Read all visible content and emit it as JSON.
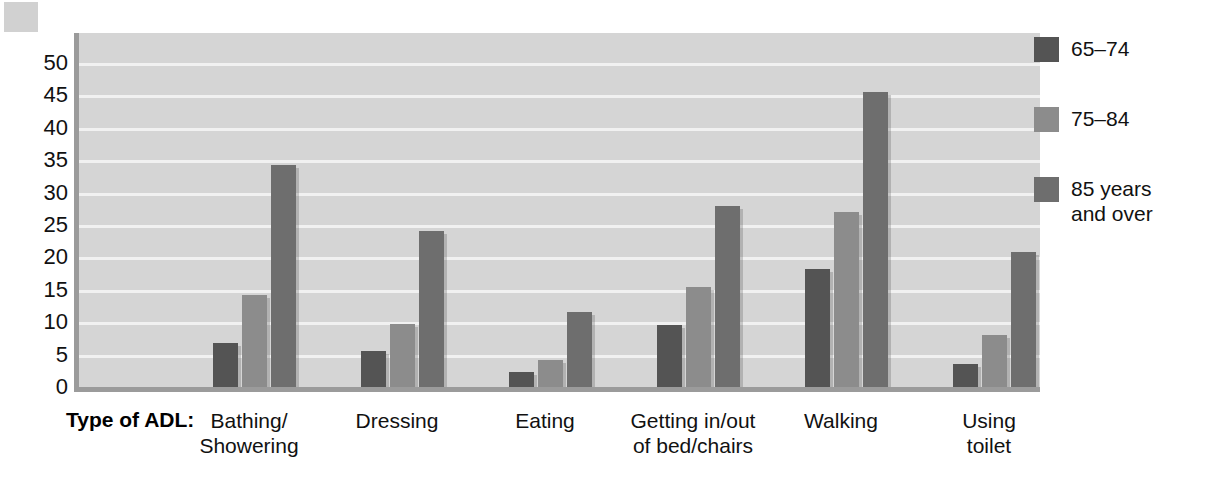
{
  "chart_data": {
    "type": "bar",
    "title": "",
    "xlabel": "Type of ADL:",
    "ylabel": "",
    "categories": [
      "Bathing/\nShowering",
      "Dressing",
      "Eating",
      "Getting in/out\nof bed/chairs",
      "Walking",
      "Using\ntoilet"
    ],
    "series": [
      {
        "name": "65–74",
        "color": "#545454",
        "values": [
          6.8,
          5.6,
          2.3,
          9.5,
          18.2,
          3.6
        ]
      },
      {
        "name": "75–84",
        "color": "#8c8c8c",
        "values": [
          14.2,
          9.7,
          4.2,
          15.4,
          27.0,
          8.0
        ]
      },
      {
        "name": "85 years\nand over",
        "color": "#6e6e6e",
        "values": [
          34.2,
          24.1,
          11.6,
          27.9,
          45.6,
          20.9
        ]
      }
    ],
    "y_ticks": [
      0,
      5,
      10,
      15,
      20,
      25,
      30,
      35,
      40,
      45,
      50
    ],
    "ylim": [
      0,
      54
    ],
    "grid": true,
    "legend_position": "right",
    "plot_background": "#d5d5d5",
    "gridline_color": "#f1f1f1",
    "axis_color": "#9b9b9b"
  },
  "legend": {
    "items": [
      {
        "label": "65–74",
        "color": "#545454"
      },
      {
        "label": "75–84",
        "color": "#8c8c8c"
      },
      {
        "label": "85 years\nand over",
        "color": "#6e6e6e"
      }
    ]
  }
}
